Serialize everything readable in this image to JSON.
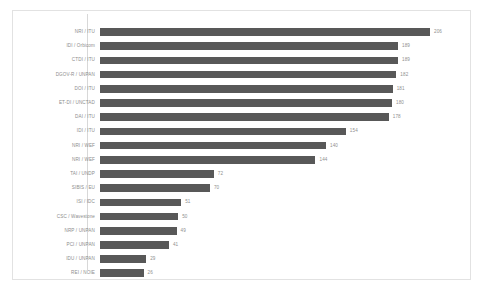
{
  "chart_data": {
    "type": "bar",
    "orientation": "horizontal",
    "title": "",
    "subtitle": "",
    "xlabel": "",
    "ylabel": "",
    "grid": false,
    "legend": false,
    "legend_position": "none",
    "bar_color": "#585858",
    "label_color": "#8d8d8d",
    "value_color": "#8f8f8f",
    "frame_color": "#e2e2e2",
    "axis_color": "#d8d8d8",
    "background": "#ffffff",
    "xlim": [
      0,
      206
    ],
    "categories": [
      "NRI / ITU",
      "IDI / Orbicom",
      "CTDI / ITU",
      "DGOV-R / UNPAN",
      "DOI / ITU",
      "ET-DI / UNCTAD",
      "DAI / ITU",
      "IDI / ITU",
      "NRI / WEF",
      "NRI / WEF",
      "TAI / UNDP",
      "SIBIS / EU",
      "ISI / IDC",
      "CSC / Wavestone",
      "NRP / UNPAN",
      "PCI / UNPAN",
      "IDU / UNPAN",
      "REI / NOIE"
    ],
    "values": [
      206,
      189,
      189,
      182,
      181,
      180,
      178,
      154,
      140,
      144,
      72,
      70,
      51,
      50,
      49,
      41,
      29,
      26
    ],
    "value_labels": [
      "206",
      "189",
      "189",
      "182",
      "181",
      "180",
      "178",
      "154",
      "140",
      "144",
      "72",
      "70",
      "51",
      "50",
      "49",
      "41",
      "29",
      "26"
    ],
    "bar_pixel_fractions": [
      1.0,
      0.903,
      0.903,
      0.898,
      0.887,
      0.885,
      0.875,
      0.745,
      0.685,
      0.653,
      0.345,
      0.333,
      0.246,
      0.237,
      0.232,
      0.209,
      0.14,
      0.132
    ]
  }
}
